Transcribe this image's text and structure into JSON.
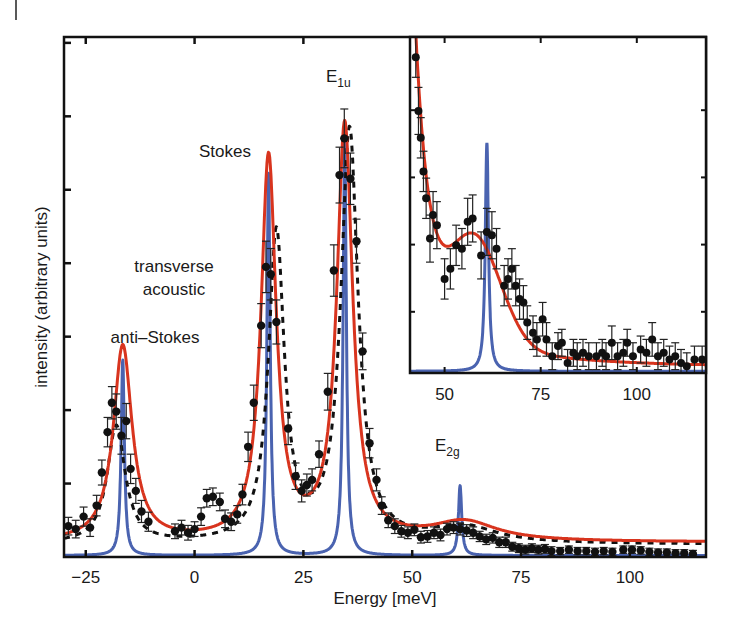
{
  "chart_data": [
    {
      "id": "main",
      "type": "line",
      "title": "",
      "xlabel": "Energy [meV]",
      "ylabel": "intensity (arbitrary units)",
      "xlim": [
        -30,
        117.5
      ],
      "ylim": [
        0,
        7.08
      ],
      "xticks": [
        -25,
        0,
        25,
        50,
        75,
        100
      ],
      "xtick_labels": [
        "−25",
        "0",
        "25",
        "50",
        "75",
        "100"
      ],
      "yticks": [
        1,
        2,
        3,
        4,
        5,
        6,
        7
      ],
      "ytick_labels_visible": false,
      "grid": false,
      "annotations": [
        {
          "text": "anti–Stokes",
          "x": -18,
          "y": 3.05
        },
        {
          "text": "transverse",
          "x": -8.5,
          "y": 4.0
        },
        {
          "text": "acoustic",
          "x": -8.5,
          "y": 3.62
        },
        {
          "text": "Stokes",
          "x": 9,
          "y": 5.45
        },
        {
          "text": "E",
          "sub": "1u",
          "x": 33.5,
          "y": 6.95
        },
        {
          "text": "E",
          "sub": "2g",
          "x": 57.5,
          "y": 1.3
        }
      ],
      "series": [
        {
          "name": "fit (Lorentzian, red)",
          "style": "solid",
          "color": "#d8341e",
          "peaks": [
            {
              "center": -16.5,
              "height": 2.66,
              "hwhm": 2.6
            },
            {
              "center": 17.0,
              "height": 5.2,
              "hwhm": 2.1
            },
            {
              "center": 34.5,
              "height": 5.64,
              "hwhm": 2.2
            },
            {
              "center": 62.0,
              "height": 0.26,
              "hwhm": 9.0
            }
          ],
          "background": {
            "base": 0.2,
            "amp": 0.05
          }
        },
        {
          "name": "theory (blue)",
          "style": "solid",
          "color": "#4a63b0",
          "peaks": [
            {
              "center": -16.5,
              "height": 2.66,
              "hwhm": 0.45
            },
            {
              "center": 17.0,
              "height": 5.2,
              "hwhm": 0.45
            },
            {
              "center": 34.5,
              "height": 5.62,
              "hwhm": 0.45
            },
            {
              "center": 61.0,
              "height": 0.95,
              "hwhm": 0.45
            }
          ],
          "background": {
            "base": 0.02,
            "amp": 0
          }
        },
        {
          "name": "model (dashed black)",
          "style": "dashed",
          "color": "#111111",
          "peaks": [
            {
              "center": -18.0,
              "height": 1.6,
              "hwhm": 2.5
            },
            {
              "center": 18.8,
              "height": 4.2,
              "hwhm": 2.2
            },
            {
              "center": 35.6,
              "height": 5.6,
              "hwhm": 2.4
            },
            {
              "center": 62.0,
              "height": 0.22,
              "hwhm": 9.0
            }
          ],
          "background": {
            "base": 0.17,
            "amp": 0
          }
        }
      ],
      "data_points": {
        "name": "measured (black circles with error bars)",
        "color": "#111111",
        "points": [
          {
            "x": -29,
            "y": 0.42,
            "err": 0.12
          },
          {
            "x": -27.3,
            "y": 0.38,
            "err": 0.12
          },
          {
            "x": -25.5,
            "y": 0.55,
            "err": 0.13
          },
          {
            "x": -24,
            "y": 0.4,
            "err": 0.12
          },
          {
            "x": -22.5,
            "y": 0.7,
            "err": 0.14
          },
          {
            "x": -21.3,
            "y": 1.15,
            "err": 0.17
          },
          {
            "x": -20.0,
            "y": 1.7,
            "err": 0.2
          },
          {
            "x": -19.0,
            "y": 2.1,
            "err": 0.22
          },
          {
            "x": -18.0,
            "y": 1.98,
            "err": 0.24
          },
          {
            "x": -16.8,
            "y": 1.65,
            "err": 0.25
          },
          {
            "x": -15.7,
            "y": 1.85,
            "err": 0.24
          },
          {
            "x": -14.7,
            "y": 1.2,
            "err": 0.2
          },
          {
            "x": -13.5,
            "y": 0.9,
            "err": 0.17
          },
          {
            "x": -12.2,
            "y": 0.62,
            "err": 0.15
          },
          {
            "x": -10.6,
            "y": 0.48,
            "err": 0.13
          },
          {
            "x": -4.5,
            "y": 0.35,
            "err": 0.1
          },
          {
            "x": -3.0,
            "y": 0.4,
            "err": 0.1
          },
          {
            "x": -1.5,
            "y": 0.33,
            "err": 0.1
          },
          {
            "x": 0.0,
            "y": 0.38,
            "err": 0.1
          },
          {
            "x": 1.5,
            "y": 0.55,
            "err": 0.12
          },
          {
            "x": 2.8,
            "y": 0.8,
            "err": 0.12
          },
          {
            "x": 4.2,
            "y": 0.82,
            "err": 0.12
          },
          {
            "x": 5.8,
            "y": 0.75,
            "err": 0.12
          },
          {
            "x": 7.0,
            "y": 0.52,
            "err": 0.12
          },
          {
            "x": 8.4,
            "y": 0.48,
            "err": 0.12
          },
          {
            "x": 9.8,
            "y": 0.58,
            "err": 0.12
          },
          {
            "x": 11.0,
            "y": 0.85,
            "err": 0.14
          },
          {
            "x": 12.3,
            "y": 1.5,
            "err": 0.2
          },
          {
            "x": 13.6,
            "y": 2.1,
            "err": 0.24
          },
          {
            "x": 15.3,
            "y": 3.15,
            "err": 0.3
          },
          {
            "x": 16.4,
            "y": 3.95,
            "err": 0.35
          },
          {
            "x": 17.5,
            "y": 3.85,
            "err": 0.35
          },
          {
            "x": 18.8,
            "y": 3.2,
            "err": 0.3
          },
          {
            "x": 21.5,
            "y": 1.75,
            "err": 0.22
          },
          {
            "x": 23.2,
            "y": 1.1,
            "err": 0.18
          },
          {
            "x": 24.6,
            "y": 0.9,
            "err": 0.15
          },
          {
            "x": 25.8,
            "y": 0.98,
            "err": 0.15
          },
          {
            "x": 27.0,
            "y": 1.05,
            "err": 0.15
          },
          {
            "x": 28.6,
            "y": 1.4,
            "err": 0.18
          },
          {
            "x": 30.6,
            "y": 2.25,
            "err": 0.25
          },
          {
            "x": 32.0,
            "y": 3.9,
            "err": 0.35
          },
          {
            "x": 33.3,
            "y": 5.2,
            "err": 0.38
          },
          {
            "x": 34.4,
            "y": 5.7,
            "err": 0.4
          },
          {
            "x": 35.8,
            "y": 5.15,
            "err": 0.35
          },
          {
            "x": 37.2,
            "y": 4.3,
            "err": 0.3
          },
          {
            "x": 38.6,
            "y": 2.8,
            "err": 0.25
          },
          {
            "x": 40.2,
            "y": 1.55,
            "err": 0.2
          },
          {
            "x": 41.8,
            "y": 1.05,
            "err": 0.15
          },
          {
            "x": 43.0,
            "y": 0.7,
            "err": 0.12
          },
          {
            "x": 44.5,
            "y": 0.5,
            "err": 0.1
          },
          {
            "x": 46.0,
            "y": 0.42,
            "err": 0.1
          },
          {
            "x": 47.5,
            "y": 0.35,
            "err": 0.08
          },
          {
            "x": 49.0,
            "y": 0.33,
            "err": 0.08
          },
          {
            "x": 50.5,
            "y": 0.37,
            "err": 0.08
          },
          {
            "x": 52.0,
            "y": 0.27,
            "err": 0.08
          },
          {
            "x": 53.5,
            "y": 0.28,
            "err": 0.08
          },
          {
            "x": 55.0,
            "y": 0.33,
            "err": 0.08
          },
          {
            "x": 56.5,
            "y": 0.3,
            "err": 0.08
          },
          {
            "x": 58.0,
            "y": 0.38,
            "err": 0.08
          },
          {
            "x": 59.5,
            "y": 0.4,
            "err": 0.08
          },
          {
            "x": 61.0,
            "y": 0.38,
            "err": 0.08
          },
          {
            "x": 62.5,
            "y": 0.36,
            "err": 0.08
          },
          {
            "x": 64.0,
            "y": 0.33,
            "err": 0.08
          },
          {
            "x": 65.5,
            "y": 0.28,
            "err": 0.07
          },
          {
            "x": 67.0,
            "y": 0.24,
            "err": 0.07
          },
          {
            "x": 68.5,
            "y": 0.26,
            "err": 0.07
          },
          {
            "x": 70.0,
            "y": 0.2,
            "err": 0.07
          },
          {
            "x": 71.5,
            "y": 0.2,
            "err": 0.07
          },
          {
            "x": 73.0,
            "y": 0.14,
            "err": 0.06
          },
          {
            "x": 74.5,
            "y": 0.12,
            "err": 0.06
          },
          {
            "x": 76.0,
            "y": 0.1,
            "err": 0.06
          },
          {
            "x": 77.5,
            "y": 0.12,
            "err": 0.06
          },
          {
            "x": 79.0,
            "y": 0.1,
            "err": 0.06
          },
          {
            "x": 80.5,
            "y": 0.11,
            "err": 0.06
          },
          {
            "x": 82.0,
            "y": 0.08,
            "err": 0.06
          },
          {
            "x": 84.0,
            "y": 0.08,
            "err": 0.05
          },
          {
            "x": 86.0,
            "y": 0.1,
            "err": 0.05
          },
          {
            "x": 88.0,
            "y": 0.08,
            "err": 0.05
          },
          {
            "x": 90.0,
            "y": 0.08,
            "err": 0.05
          },
          {
            "x": 92.0,
            "y": 0.07,
            "err": 0.05
          },
          {
            "x": 94.0,
            "y": 0.08,
            "err": 0.05
          },
          {
            "x": 96.0,
            "y": 0.07,
            "err": 0.05
          },
          {
            "x": 98.5,
            "y": 0.1,
            "err": 0.05
          },
          {
            "x": 100.5,
            "y": 0.1,
            "err": 0.05
          },
          {
            "x": 102.5,
            "y": 0.09,
            "err": 0.05
          },
          {
            "x": 104.5,
            "y": 0.07,
            "err": 0.05
          },
          {
            "x": 106.5,
            "y": 0.06,
            "err": 0.05
          },
          {
            "x": 108.5,
            "y": 0.06,
            "err": 0.05
          },
          {
            "x": 110.5,
            "y": 0.05,
            "err": 0.05
          },
          {
            "x": 112.5,
            "y": 0.05,
            "err": 0.05
          },
          {
            "x": 114.5,
            "y": 0.04,
            "err": 0.05
          }
        ]
      }
    },
    {
      "id": "inset",
      "type": "line",
      "title": "",
      "xlabel": "",
      "ylabel": "",
      "xlim": [
        41,
        118
      ],
      "ylim": [
        0,
        1
      ],
      "xticks": [
        50,
        75,
        100
      ],
      "xtick_labels": [
        "50",
        "75",
        "100"
      ],
      "grid": false,
      "series": [
        {
          "name": "fit (red)",
          "color": "#d8341e",
          "description": "steep descending tail from E1u, shoulder ~0.33 near 60 meV, decays to ~0.03 at 118 meV"
        },
        {
          "name": "theory (blue)",
          "color": "#4a63b0",
          "peaks": [
            {
              "center": 61,
              "height": 0.68,
              "hwhm": 0.5
            }
          ]
        }
      ],
      "data_points": {
        "name": "measured (black circles with error bars)",
        "points": [
          {
            "x": 42.5,
            "y": 0.94,
            "err": 0.06
          },
          {
            "x": 43.2,
            "y": 0.78,
            "err": 0.07
          },
          {
            "x": 43.8,
            "y": 0.7,
            "err": 0.06
          },
          {
            "x": 44.5,
            "y": 0.6,
            "err": 0.06
          },
          {
            "x": 45.2,
            "y": 0.52,
            "err": 0.06
          },
          {
            "x": 46.2,
            "y": 0.4,
            "err": 0.07
          },
          {
            "x": 47.0,
            "y": 0.47,
            "err": 0.07
          },
          {
            "x": 48.0,
            "y": 0.44,
            "err": 0.07
          },
          {
            "x": 50.0,
            "y": 0.28,
            "err": 0.06
          },
          {
            "x": 51.5,
            "y": 0.31,
            "err": 0.06
          },
          {
            "x": 53.0,
            "y": 0.38,
            "err": 0.06
          },
          {
            "x": 54.5,
            "y": 0.37,
            "err": 0.06
          },
          {
            "x": 56.0,
            "y": 0.45,
            "err": 0.07
          },
          {
            "x": 57.3,
            "y": 0.46,
            "err": 0.07
          },
          {
            "x": 59.5,
            "y": 0.35,
            "err": 0.07
          },
          {
            "x": 61.0,
            "y": 0.42,
            "err": 0.07
          },
          {
            "x": 62.3,
            "y": 0.41,
            "err": 0.07
          },
          {
            "x": 63.5,
            "y": 0.37,
            "err": 0.06
          },
          {
            "x": 65.5,
            "y": 0.26,
            "err": 0.06
          },
          {
            "x": 66.5,
            "y": 0.28,
            "err": 0.06
          },
          {
            "x": 67.5,
            "y": 0.31,
            "err": 0.06
          },
          {
            "x": 68.5,
            "y": 0.26,
            "err": 0.06
          },
          {
            "x": 69.5,
            "y": 0.22,
            "err": 0.06
          },
          {
            "x": 70.5,
            "y": 0.21,
            "err": 0.05
          },
          {
            "x": 71.5,
            "y": 0.15,
            "err": 0.05
          },
          {
            "x": 73.0,
            "y": 0.12,
            "err": 0.05
          },
          {
            "x": 74.0,
            "y": 0.1,
            "err": 0.05
          },
          {
            "x": 75.5,
            "y": 0.16,
            "err": 0.05
          },
          {
            "x": 76.5,
            "y": 0.1,
            "err": 0.05
          },
          {
            "x": 78.0,
            "y": 0.05,
            "err": 0.04
          },
          {
            "x": 79.5,
            "y": 0.08,
            "err": 0.04
          },
          {
            "x": 80.5,
            "y": 0.09,
            "err": 0.04
          },
          {
            "x": 82.0,
            "y": 0.03,
            "err": 0.04
          },
          {
            "x": 83.5,
            "y": 0.06,
            "err": 0.04
          },
          {
            "x": 84.5,
            "y": 0.05,
            "err": 0.04
          },
          {
            "x": 86.0,
            "y": 0.06,
            "err": 0.04
          },
          {
            "x": 87.5,
            "y": 0.05,
            "err": 0.04
          },
          {
            "x": 89.5,
            "y": 0.05,
            "err": 0.04
          },
          {
            "x": 91.0,
            "y": 0.06,
            "err": 0.04
          },
          {
            "x": 92.0,
            "y": 0.05,
            "err": 0.04
          },
          {
            "x": 93.5,
            "y": 0.09,
            "err": 0.05
          },
          {
            "x": 95.0,
            "y": 0.05,
            "err": 0.04
          },
          {
            "x": 96.5,
            "y": 0.06,
            "err": 0.04
          },
          {
            "x": 97.5,
            "y": 0.09,
            "err": 0.04
          },
          {
            "x": 99.0,
            "y": 0.05,
            "err": 0.04
          },
          {
            "x": 101.0,
            "y": 0.07,
            "err": 0.04
          },
          {
            "x": 102.5,
            "y": 0.06,
            "err": 0.04
          },
          {
            "x": 104.0,
            "y": 0.1,
            "err": 0.05
          },
          {
            "x": 105.5,
            "y": 0.05,
            "err": 0.04
          },
          {
            "x": 107.0,
            "y": 0.06,
            "err": 0.04
          },
          {
            "x": 108.5,
            "y": 0.04,
            "err": 0.04
          },
          {
            "x": 110.0,
            "y": 0.05,
            "err": 0.04
          },
          {
            "x": 111.5,
            "y": 0.03,
            "err": 0.04
          },
          {
            "x": 113.0,
            "y": 0.02,
            "err": 0.04
          },
          {
            "x": 115.0,
            "y": 0.04,
            "err": 0.04
          },
          {
            "x": 117.0,
            "y": 0.04,
            "err": 0.04
          }
        ]
      }
    }
  ],
  "labels": {
    "xlabel": "Energy [meV]",
    "ylabel": "intensity (arbitrary units)",
    "anti_stokes": "anti–Stokes",
    "transverse": "transverse",
    "acoustic": "acoustic",
    "stokes": "Stokes",
    "e1u_main": "E",
    "e1u_sub": "1u",
    "e2g_main": "E",
    "e2g_sub": "2g"
  },
  "colors": {
    "fit": "#d8341e",
    "theory": "#4a63b0",
    "data": "#111111",
    "frame": "#111111"
  }
}
